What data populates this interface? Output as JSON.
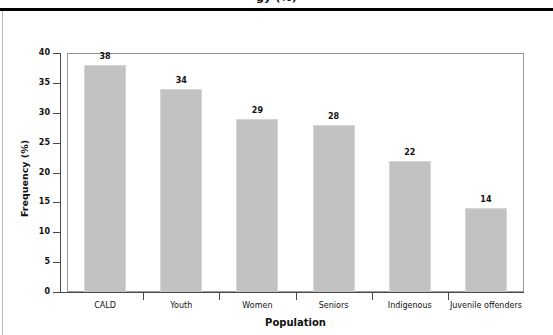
{
  "page": {
    "clipped_heading": "gy (%)",
    "background_color": "#ffffff"
  },
  "chart_data": {
    "type": "bar",
    "title": "",
    "subtitle": "",
    "xlabel": "Population",
    "ylabel": "Frequency (%)",
    "categories": [
      "CALD",
      "Youth",
      "Women",
      "Seniors",
      "Indigenous",
      "Juvenile offenders"
    ],
    "values": [
      38,
      34,
      29,
      28,
      22,
      14
    ],
    "data_labels": [
      "38",
      "34",
      "29",
      "28",
      "22",
      "14"
    ],
    "ylim": [
      0,
      40
    ],
    "ytick_values": [
      0,
      5,
      10,
      15,
      20,
      25,
      30,
      35,
      40
    ],
    "ytick_labels": [
      "0",
      "5",
      "10",
      "15",
      "20",
      "25",
      "30",
      "35",
      "40"
    ],
    "grid": false,
    "legend": null,
    "legend_position": "none",
    "bar_color": "#c2c2c2",
    "bar_edge_color": "#d6d6d6",
    "axis_color": "#4a4a4a",
    "frame_color": "#9a9a9a",
    "text_color": "#111111"
  }
}
